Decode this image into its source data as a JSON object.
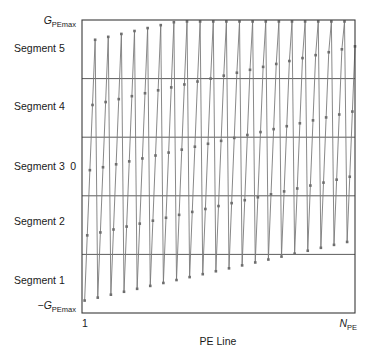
{
  "figure": {
    "title": "",
    "plot_box": {
      "left": 82,
      "top": 20,
      "right": 355,
      "bottom": 313
    }
  },
  "labels": {
    "y_top_main": "G",
    "y_top_sub": "PEmax",
    "y_bottom_sign": "−",
    "y_bottom_main": "G",
    "y_bottom_sub": "PEmax",
    "y_zero": "0",
    "x_left": "1",
    "x_right_main": "N",
    "x_right_sub": "PE",
    "x_axis_title": "PE Line",
    "segments": [
      "Segment 1",
      "Segment 2",
      "Segment 3",
      "Segment 4",
      "Segment 5"
    ]
  },
  "colors": {
    "line": "#7a7a7a",
    "marker": "#6e6e6e",
    "axis": "#3a3a3a",
    "divider": "#4a4a4a",
    "background": "#ffffff",
    "text": "#1a1a1a"
  },
  "chart_data": {
    "type": "line",
    "title": "",
    "xlabel": "PE Line",
    "ylabel": "",
    "xlim": [
      0,
      104
    ],
    "ylim": [
      -1,
      1
    ],
    "x_tick_labels": [
      "1",
      "N_PE"
    ],
    "y_tick_labels": [
      "-G_PEmax",
      "0",
      "G_PEmax"
    ],
    "grid": false,
    "legend": "none",
    "segment_boundaries": [
      -0.6,
      -0.2,
      0.2,
      0.6
    ],
    "segment_count": 5,
    "series": [
      {
        "name": "PE gradient amplitude",
        "x": [
          1,
          2,
          3,
          4,
          5,
          6,
          7,
          8,
          9,
          10,
          11,
          12,
          13,
          14,
          15,
          16,
          17,
          18,
          19,
          20,
          21,
          22,
          23,
          24,
          25,
          26,
          27,
          28,
          29,
          30,
          31,
          32,
          33,
          34,
          35,
          36,
          37,
          38,
          39,
          40,
          41,
          42,
          43,
          44,
          45,
          46,
          47,
          48,
          49,
          50,
          51,
          52,
          53,
          54,
          55,
          56,
          57,
          58,
          59,
          60,
          61,
          62,
          63,
          64,
          65,
          66,
          67,
          68,
          69,
          70,
          71,
          72,
          73,
          74,
          75,
          76,
          77,
          78,
          79,
          80,
          81,
          82,
          83,
          84,
          85,
          86,
          87,
          88,
          89,
          90,
          91,
          92,
          93,
          94,
          95,
          96,
          97,
          98,
          99,
          100,
          101,
          102,
          103,
          104
        ],
        "y": [
          -0.915,
          -0.47,
          -0.025,
          0.42,
          0.865,
          -0.895,
          -0.45,
          -0.005,
          0.44,
          0.885,
          -0.875,
          -0.43,
          0.015,
          0.46,
          0.905,
          -0.855,
          -0.41,
          0.035,
          0.48,
          0.925,
          -0.835,
          -0.39,
          0.055,
          0.5,
          0.945,
          -0.815,
          -0.37,
          0.075,
          0.52,
          0.965,
          -0.795,
          -0.35,
          0.095,
          0.54,
          0.985,
          -0.775,
          -0.33,
          0.115,
          0.56,
          0.99,
          -0.755,
          -0.31,
          0.135,
          0.58,
          0.99,
          -0.735,
          -0.29,
          0.155,
          0.6,
          0.99,
          -0.715,
          -0.27,
          0.175,
          0.62,
          0.99,
          -0.695,
          -0.25,
          0.195,
          0.64,
          0.99,
          -0.675,
          -0.23,
          0.215,
          0.66,
          0.99,
          -0.655,
          -0.21,
          0.235,
          0.68,
          0.99,
          -0.635,
          -0.19,
          0.255,
          0.7,
          0.99,
          -0.615,
          -0.17,
          0.275,
          0.72,
          0.99,
          -0.595,
          -0.15,
          0.295,
          0.74,
          0.99,
          -0.575,
          -0.13,
          0.315,
          0.76,
          0.99,
          -0.555,
          -0.11,
          0.335,
          0.78,
          0.99,
          -0.535,
          -0.09,
          0.355,
          0.8,
          0.99,
          -0.515,
          -0.07,
          0.375,
          0.82
        ]
      }
    ]
  }
}
